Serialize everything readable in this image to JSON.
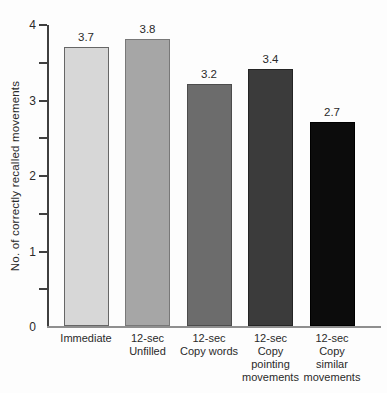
{
  "chart_data": {
    "type": "bar",
    "title": "",
    "xlabel": "",
    "ylabel": "No. of correctly recalled movements",
    "ylim": [
      0,
      4
    ],
    "ytick_values": [
      0,
      1,
      2,
      3,
      4
    ],
    "ytick_labels": [
      "0",
      "1",
      "2",
      "3",
      "4"
    ],
    "ytick_minor_step": 0.5,
    "grid": false,
    "legend": false,
    "categories": [
      [
        "Immediate"
      ],
      [
        "12-sec",
        "Unfilled"
      ],
      [
        "12-sec",
        "Copy words"
      ],
      [
        "12-sec",
        "Copy",
        "pointing",
        "movements"
      ],
      [
        "12-sec",
        "Copy",
        "similar",
        "movements"
      ]
    ],
    "values": [
      3.7,
      3.8,
      3.2,
      3.4,
      2.7
    ],
    "data_labels": [
      "3.7",
      "3.8",
      "3.2",
      "3.4",
      "2.7"
    ],
    "bar_fill_colors": [
      "#d7d7d7",
      "#a6a6a6",
      "#6c6c6c",
      "#3b3b3b",
      "#0c0c0c"
    ],
    "bar_border_colors": [
      "#666666",
      "#787878",
      "#4c4c4c",
      "#252525",
      "#000000"
    ],
    "axis_color": "#3f3f3f",
    "baseline_color": "#8f8f8f",
    "text_color": "#2a2a2a"
  }
}
